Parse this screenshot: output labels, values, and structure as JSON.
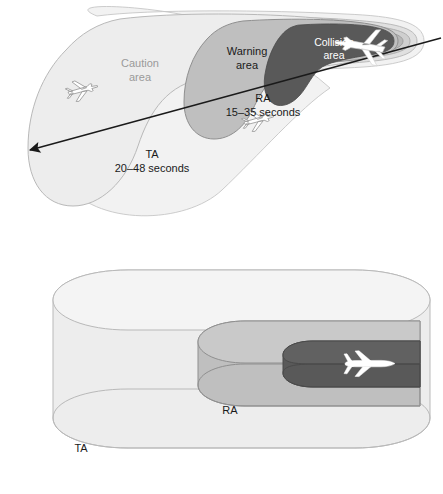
{
  "figure": {
    "name": "tcas-protected-volume-diagram",
    "panels": [
      {
        "id": "plan-view",
        "description": "horizontal plan view of TCAS protected airspace"
      },
      {
        "id": "volume-view",
        "description": "three dimensional cylindrical volume view"
      }
    ]
  },
  "colors": {
    "caution_fill": "#ededed",
    "warning_fill": "#bfbfbf",
    "collision_fill": "#595959",
    "ring_outer": "#e4e4e4",
    "ring_mid": "#cfcfcf",
    "ring_inner": "#a8a8a8",
    "outline": "#8a8a8a",
    "outline_dark": "#6f6f6f",
    "track_line": "#1a1a1a",
    "text_dark": "#1a1a1a",
    "text_gray": "#9a9a9a",
    "text_white": "#ffffff",
    "aircraft_white": "#ffffff",
    "aircraft_outline": "#8f8f8f",
    "page_background": "#ffffff"
  },
  "plan_view": {
    "labels": {
      "caution_area": "Caution\narea",
      "caution_area_line1": "Caution",
      "caution_area_line2": "area",
      "warning_area_line1": "Warning",
      "warning_area_line2": "area",
      "collision_area_line1": "Collision",
      "collision_area_line2": "area",
      "ra_title": "RA",
      "ra_timing": "15–35 seconds",
      "ta_title": "TA",
      "ta_timing": "20–48 seconds"
    },
    "track": {
      "name": "intruder-track-arrow",
      "direction": "right-to-left",
      "has_arrowhead": true
    },
    "aircraft": [
      {
        "id": "aircraft-caution-zone",
        "zone": "Caution area"
      },
      {
        "id": "aircraft-ra-zone",
        "zone": "RA"
      },
      {
        "id": "aircraft-collision-zone",
        "zone": "Collision area"
      }
    ]
  },
  "volume_view": {
    "labels": {
      "ra_title": "RA",
      "ta_title": "TA"
    },
    "cylinders": [
      {
        "id": "ta-cylinder",
        "label": "TA",
        "shade": "light"
      },
      {
        "id": "ra-cylinder",
        "label": "RA",
        "shade": "medium"
      },
      {
        "id": "collision-cylinder",
        "label": "",
        "shade": "dark"
      }
    ],
    "aircraft": [
      {
        "id": "aircraft-collision-volume",
        "zone": "collision cylinder"
      }
    ]
  }
}
